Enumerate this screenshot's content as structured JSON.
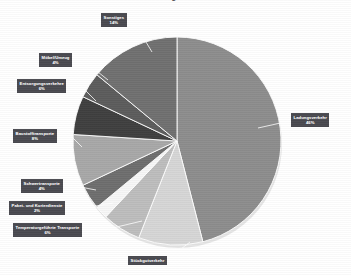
{
  "chart_data": {
    "type": "pie",
    "title": "Anteile der Verkehrssegmente am Güterverkehr",
    "xlabel": "",
    "ylabel": "",
    "grid": false,
    "legend_position": "none",
    "labels_inside": false,
    "start_angle_deg": 0,
    "direction": "clockwise",
    "categories": [
      "Ladungsverkehr",
      "Stückgutverkehr",
      "Temperaturgeführte Transporte",
      "Paket- und Kurierdienste",
      "Schwertransporte",
      "Baustofftransporte",
      "Entsorgungsverkehre",
      "Möbel/Umzug",
      "Sonstiges"
    ],
    "values": [
      46,
      10,
      6,
      2,
      4,
      8,
      6,
      4,
      14
    ],
    "value_labels": [
      "46%",
      "",
      "6%",
      "2%",
      "4%",
      "8%",
      "6%",
      "4%",
      "14%"
    ],
    "colors": [
      "#8d8d8d",
      "#d6d6d6",
      "#bdbdbd",
      "#f7f7f7",
      "#6e6e6e",
      "#a8a8a8",
      "#3f3f3f",
      "#5c5c5c",
      "#707070"
    ]
  },
  "slices": [
    {
      "name": "Ladungsverkehr",
      "percent_text": "46%",
      "value": 46,
      "color": "#8d8d8d",
      "label_x": 291,
      "label_y": 113,
      "leader": [
        285,
        122,
        258,
        128
      ]
    },
    {
      "name": "Stückgutverkehr",
      "percent_text": "",
      "value": 10,
      "color": "#d6d6d6",
      "label_x": 128,
      "label_y": 256,
      "leader": [
        172,
        256,
        190,
        242
      ]
    },
    {
      "name": "Temperaturgeführte Transporte",
      "percent_text": "6%",
      "value": 6,
      "color": "#bdbdbd",
      "label_x": 13,
      "label_y": 223,
      "leader": [
        104,
        230,
        142,
        221
      ]
    },
    {
      "name": "Paket- und Kurierdienste",
      "percent_text": "2%",
      "value": 2,
      "color": "#f7f7f7",
      "label_x": 9,
      "label_y": 201,
      "leader": [
        84,
        208,
        113,
        203
      ]
    },
    {
      "name": "Schwertransporte",
      "percent_text": "4%",
      "value": 4,
      "color": "#6e6e6e",
      "label_x": 21,
      "label_y": 179,
      "leader": [
        75,
        186,
        96,
        190
      ]
    },
    {
      "name": "Baustofftransporte",
      "percent_text": "8%",
      "value": 8,
      "color": "#a8a8a8",
      "label_x": 13,
      "label_y": 129,
      "leader": [
        71,
        136,
        82,
        147
      ]
    },
    {
      "name": "Entsorgungsverkehre",
      "percent_text": "6%",
      "value": 6,
      "color": "#3f3f3f",
      "label_x": 17,
      "label_y": 79,
      "leader": [
        81,
        86,
        96,
        101
      ]
    },
    {
      "name": "Möbel/Umzug",
      "percent_text": "4%",
      "value": 4,
      "color": "#5c5c5c",
      "label_x": 39,
      "label_y": 53,
      "leader": [
        83,
        60,
        108,
        80
      ]
    },
    {
      "name": "Sonstiges",
      "percent_text": "14%",
      "value": 14,
      "color": "#707070",
      "label_x": 101,
      "label_y": 13,
      "leader": [
        134,
        22,
        152,
        52
      ]
    }
  ],
  "geometry": {
    "center_x": 177,
    "center_y": 141,
    "radius": 104
  },
  "theme": {
    "background": "#ffffff",
    "label_box_bg": "#4a4a50",
    "label_text": "#ffffff",
    "leader_line": "#ffffff",
    "title_color": "#3f3f46"
  }
}
